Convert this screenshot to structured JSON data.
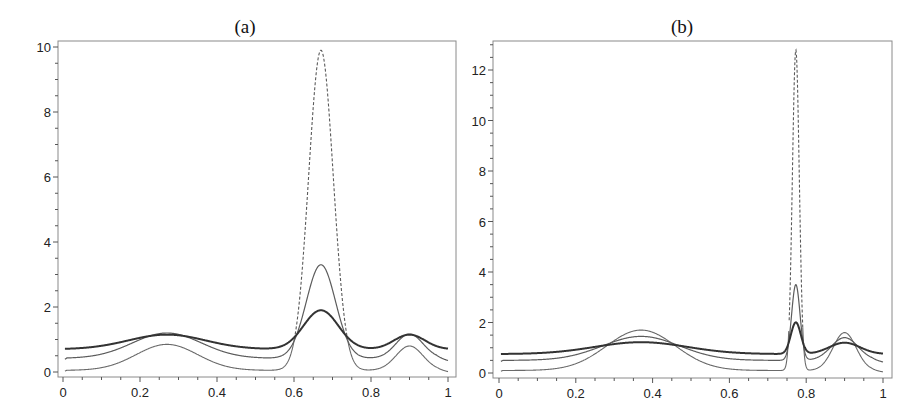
{
  "figure": {
    "panels": [
      {
        "id": "a",
        "title": "(a)",
        "frame": {
          "left": 58,
          "right": 456,
          "top": 41,
          "bottom": 377
        },
        "xmap": {
          "x0": 63,
          "x1": 448
        },
        "ymap": {
          "y0": 372,
          "pxPerUnit": 32.5
        },
        "yticks": [
          0,
          2,
          4,
          6,
          8,
          10
        ],
        "yminor_step": 0.5,
        "ymax_minor": 10,
        "xticks": [
          0,
          0.2,
          0.4,
          0.6,
          0.8,
          1
        ],
        "xtick_labels": [
          "0",
          "0.2",
          "0.4",
          "0.6",
          "0.8",
          "1"
        ],
        "ytick_labels": [
          "0",
          "2",
          "4",
          "6",
          "8",
          "10"
        ],
        "dash_threshold": 1.0,
        "model": {
          "low": {
            "base": 0.05,
            "g": [
              [
                0.27,
                0.8,
                0.08
              ],
              [
                0.67,
                9.85,
                0.032
              ],
              [
                0.9,
                0.75,
                0.035
              ]
            ],
            "taper": 0.05
          },
          "mid": {
            "base": 0.42,
            "g": [
              [
                0.27,
                0.78,
                0.09
              ],
              [
                0.67,
                2.88,
                0.038
              ],
              [
                0.9,
                0.75,
                0.035
              ]
            ],
            "taper": 0.08
          },
          "thick": {
            "base": 0.7,
            "g": [
              [
                0.27,
                0.45,
                0.1
              ],
              [
                0.67,
                1.2,
                0.045
              ],
              [
                0.9,
                0.45,
                0.04
              ]
            ],
            "taper": 0.0
          }
        }
      },
      {
        "id": "b",
        "title": "(b)",
        "frame": {
          "left": 493,
          "right": 892,
          "top": 41,
          "bottom": 378
        },
        "xmap": {
          "x0": 499,
          "x1": 883
        },
        "ymap": {
          "y0": 373,
          "pxPerUnit": 25.25
        },
        "yticks": [
          0,
          2,
          4,
          6,
          8,
          10,
          12
        ],
        "yminor_step": 0.5,
        "ymax_minor": 13,
        "xticks": [
          0,
          0.2,
          0.4,
          0.6,
          0.8,
          1
        ],
        "xtick_labels": [
          "0",
          "0.2",
          "0.4",
          "0.6",
          "0.8",
          "1"
        ],
        "ytick_labels": [
          "0",
          "2",
          "4",
          "6",
          "8",
          "10",
          "12"
        ],
        "dash_threshold": 1.8,
        "model": {
          "low": {
            "base": 0.1,
            "g": [
              [
                0.37,
                1.6,
                0.09
              ],
              [
                0.773,
                12.7,
                0.009
              ],
              [
                0.9,
                1.5,
                0.03
              ]
            ],
            "taper": 0.06
          },
          "mid": {
            "base": 0.5,
            "g": [
              [
                0.37,
                0.95,
                0.1
              ],
              [
                0.773,
                3.0,
                0.011
              ],
              [
                0.9,
                0.9,
                0.035
              ]
            ],
            "taper": 0.08
          },
          "thick": {
            "base": 0.75,
            "g": [
              [
                0.37,
                0.47,
                0.12
              ],
              [
                0.773,
                1.25,
                0.013
              ],
              [
                0.9,
                0.45,
                0.04
              ]
            ],
            "taper": 0.0
          }
        }
      }
    ]
  },
  "chart_data": [
    {
      "type": "line",
      "title": "(a)",
      "xlabel": "",
      "ylabel": "",
      "xlim": [
        0,
        1
      ],
      "ylim": [
        0,
        10
      ],
      "grid": false,
      "legend": null,
      "x": [
        0,
        0.1,
        0.2,
        0.3,
        0.4,
        0.5,
        0.6,
        0.67,
        0.7,
        0.8,
        0.9,
        1.0
      ],
      "series": [
        {
          "name": "dashed-peak curve (lowest baseline)",
          "style": "thin, dashed near peak",
          "values": [
            0.05,
            0.13,
            0.6,
            0.8,
            0.26,
            0.06,
            0.95,
            9.9,
            6.4,
            0.06,
            0.8,
            0.02
          ]
        },
        {
          "name": "thin middle curve",
          "style": "thin solid",
          "values": [
            0.42,
            0.55,
            1.0,
            1.15,
            0.75,
            0.45,
            1.35,
            3.3,
            2.75,
            0.45,
            1.17,
            0.35
          ]
        },
        {
          "name": "thick curve",
          "style": "thick solid",
          "values": [
            0.7,
            0.8,
            1.08,
            1.13,
            0.95,
            0.72,
            1.14,
            1.9,
            1.82,
            0.72,
            1.15,
            0.7
          ]
        }
      ],
      "xticks": [
        "0",
        "0.2",
        "0.4",
        "0.6",
        "0.8",
        "1"
      ],
      "yticks": [
        "0",
        "2",
        "4",
        "6",
        "8",
        "10"
      ]
    },
    {
      "type": "line",
      "title": "(b)",
      "xlabel": "",
      "ylabel": "",
      "xlim": [
        0,
        1
      ],
      "ylim": [
        0,
        13
      ],
      "grid": false,
      "legend": null,
      "x": [
        0,
        0.1,
        0.2,
        0.3,
        0.37,
        0.4,
        0.5,
        0.6,
        0.7,
        0.773,
        0.8,
        0.9,
        1.0
      ],
      "series": [
        {
          "name": "dashed-peak curve (lowest baseline)",
          "style": "thin, dashed near peak",
          "values": [
            0.1,
            0.13,
            0.35,
            1.05,
            1.7,
            1.6,
            0.85,
            0.2,
            0.1,
            12.8,
            0.1,
            1.6,
            0.05
          ]
        },
        {
          "name": "thin middle curve",
          "style": "thin solid",
          "values": [
            0.5,
            0.55,
            0.75,
            1.2,
            1.45,
            1.4,
            1.05,
            0.62,
            0.52,
            3.5,
            0.55,
            1.4,
            0.45
          ]
        },
        {
          "name": "thick curve",
          "style": "thick solid",
          "values": [
            0.75,
            0.8,
            0.92,
            1.15,
            1.2,
            1.2,
            1.1,
            0.9,
            0.78,
            2.0,
            0.77,
            1.2,
            0.72
          ]
        }
      ],
      "xticks": [
        "0",
        "0.2",
        "0.4",
        "0.6",
        "0.8",
        "1"
      ],
      "yticks": [
        "0",
        "2",
        "4",
        "6",
        "8",
        "10",
        "12"
      ]
    }
  ]
}
